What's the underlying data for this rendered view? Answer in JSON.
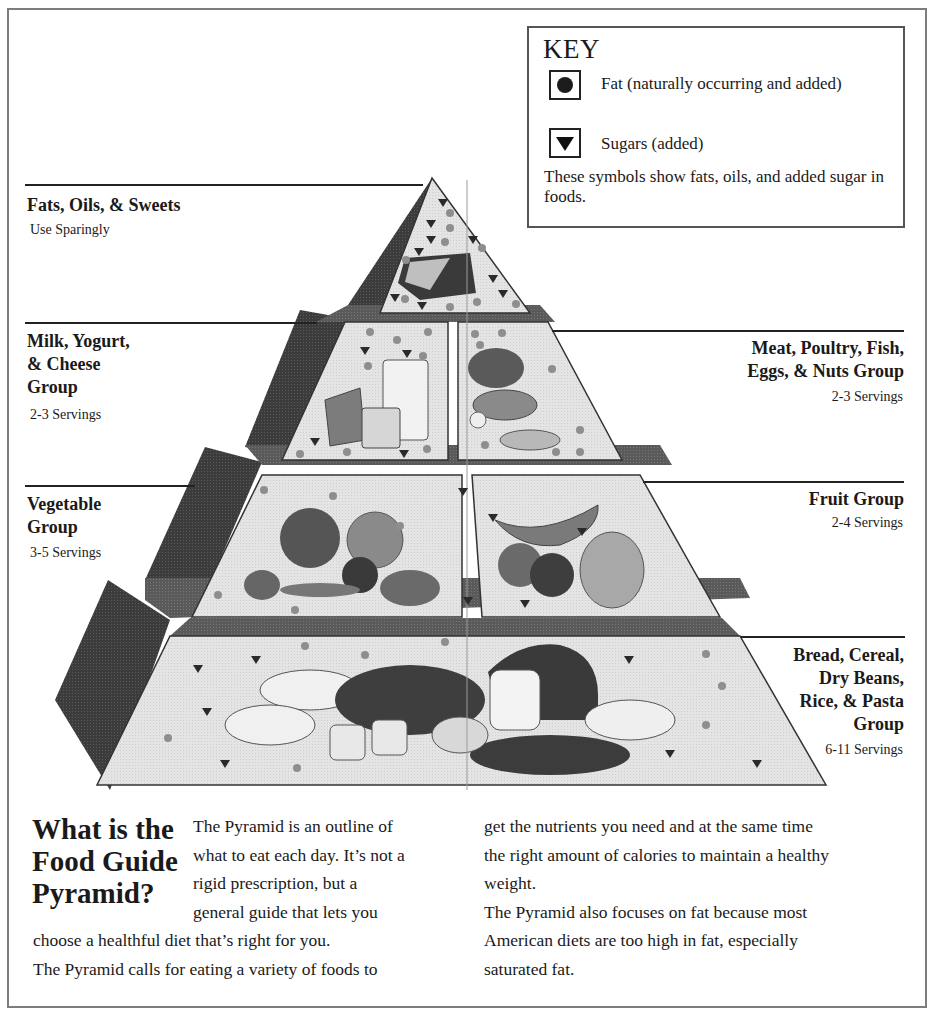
{
  "key": {
    "title": "KEY",
    "items": [
      {
        "symbol": "fat-circle-icon",
        "label": "Fat (naturally occurring and added)"
      },
      {
        "symbol": "sugar-triangle-icon",
        "label": "Sugars (added)"
      }
    ],
    "note": "These symbols show fats, oils, and added sugar in foods."
  },
  "groups": [
    {
      "id": "fats",
      "name_lines": [
        "Fats, Oils, & Sweets"
      ],
      "servings": "Use Sparingly",
      "side": "left"
    },
    {
      "id": "milk",
      "name_lines": [
        "Milk, Yogurt,",
        "& Cheese",
        "Group"
      ],
      "servings": "2-3 Servings",
      "side": "left"
    },
    {
      "id": "meat",
      "name_lines": [
        "Meat, Poultry, Fish,",
        "Eggs, & Nuts Group"
      ],
      "servings": "2-3 Servings",
      "side": "right"
    },
    {
      "id": "vegetable",
      "name_lines": [
        "Vegetable",
        "Group"
      ],
      "servings": "3-5 Servings",
      "side": "left"
    },
    {
      "id": "fruit",
      "name_lines": [
        "Fruit Group"
      ],
      "servings": "2-4 Servings",
      "side": "right"
    },
    {
      "id": "bread",
      "name_lines": [
        "Bread, Cereal,",
        "Dry Beans,",
        "Rice, & Pasta",
        "Group"
      ],
      "servings": "6-11 Servings",
      "side": "right"
    }
  ],
  "article": {
    "headline_lines": [
      "What is the",
      "Food Guide",
      "Pyramid?"
    ],
    "col1_wrap_lines": [
      "The Pyramid is an outline of",
      "what to eat each day. It’s not a",
      "rigid prescription, but a",
      "general guide that lets you"
    ],
    "col1_full_lines": [
      "choose a healthful diet that’s right for you.",
      "The Pyramid calls for eating a variety of foods to"
    ],
    "col2_lines": [
      "get the nutrients you need and at the same time",
      "the right amount of calories to maintain a healthy",
      "weight.",
      "The Pyramid also focuses on fat because most",
      "American diets are too high in fat, especially",
      "saturated fat."
    ]
  },
  "colors": {
    "frame": "#7d7d7d",
    "face": "#e2e2e2",
    "side_dark": "#3a3a3a",
    "band_dark": "#555555",
    "dot": "#8e8e8e",
    "ink": "#1a1a1a"
  }
}
